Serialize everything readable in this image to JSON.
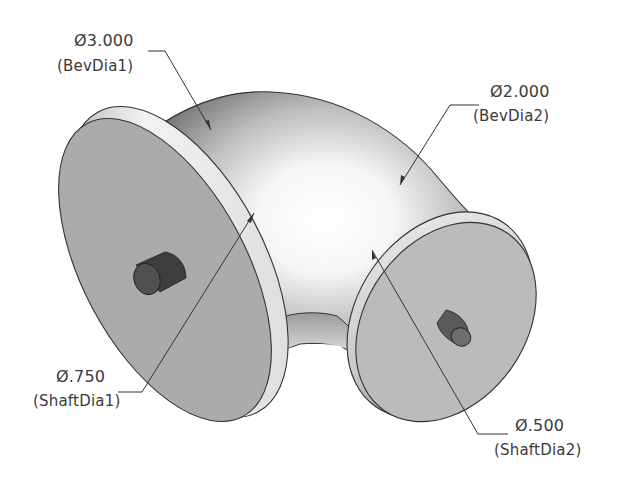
{
  "drawing": {
    "description": "Isometric shaded model of a 90-degree elbow pipe with two circular flanges, each with a small shaft boss",
    "colors": {
      "background": "#ffffff",
      "flange_face": "#a9a9a9",
      "flange_rim": "#e8e8e8",
      "body_dark": "#7d7d7d",
      "body_highlight": "#ffffff",
      "boss": "#4a4a4a",
      "line": "#333333",
      "text": "#3a3a3a"
    }
  },
  "annotations": [
    {
      "id": "bevdia1",
      "value": "Ø3.000",
      "name": "(BevDia1)"
    },
    {
      "id": "bevdia2",
      "value": "Ø2.000",
      "name": "(BevDia2)"
    },
    {
      "id": "shaftdia1",
      "value": "Ø.750",
      "name": "(ShaftDia1)"
    },
    {
      "id": "shaftdia2",
      "value": "Ø.500",
      "name": "(ShaftDia2)"
    }
  ]
}
